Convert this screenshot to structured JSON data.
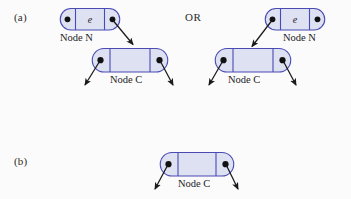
{
  "figure": {
    "title_visible": false,
    "background": "#fbfbfb",
    "node_fill": "#dde1f2",
    "node_stroke": "#4a4ab4",
    "pointer_dot_color": "#111111",
    "arrow_color": "#1a1a1a",
    "text_color": "#232323"
  },
  "parts": {
    "a": {
      "label": "(a)",
      "or_label": "OR",
      "left_variant": {
        "node_n": {
          "label": "Node N",
          "cells": [
            {
              "name": "left-pointer-cell",
              "kind": "pointer",
              "value": ""
            },
            {
              "name": "element-cell",
              "kind": "value",
              "value": "e"
            },
            {
              "name": "right-pointer-cell",
              "kind": "pointer",
              "value": ""
            }
          ]
        },
        "node_c": {
          "label": "Node C",
          "cells": [
            {
              "name": "left-pointer-cell",
              "kind": "pointer",
              "value": ""
            },
            {
              "name": "element-cell",
              "kind": "value",
              "value": ""
            },
            {
              "name": "right-pointer-cell",
              "kind": "pointer",
              "value": ""
            }
          ]
        },
        "link_from": "node-n-right-pointer",
        "link_to": "node-c"
      },
      "right_variant": {
        "node_n": {
          "label": "Node N",
          "cells": [
            {
              "name": "left-pointer-cell",
              "kind": "pointer",
              "value": ""
            },
            {
              "name": "element-cell",
              "kind": "value",
              "value": "e"
            },
            {
              "name": "right-pointer-cell",
              "kind": "pointer",
              "value": ""
            }
          ]
        },
        "node_c": {
          "label": "Node C",
          "cells": [
            {
              "name": "left-pointer-cell",
              "kind": "pointer",
              "value": ""
            },
            {
              "name": "element-cell",
              "kind": "value",
              "value": ""
            },
            {
              "name": "right-pointer-cell",
              "kind": "pointer",
              "value": ""
            }
          ]
        },
        "link_from": "node-n-left-pointer",
        "link_to": "node-c"
      }
    },
    "b": {
      "label": "(b)",
      "node_c": {
        "label": "Node C",
        "cells": [
          {
            "name": "left-pointer-cell",
            "kind": "pointer",
            "value": ""
          },
          {
            "name": "element-cell",
            "kind": "value",
            "value": ""
          },
          {
            "name": "right-pointer-cell",
            "kind": "pointer",
            "value": ""
          }
        ]
      }
    }
  }
}
